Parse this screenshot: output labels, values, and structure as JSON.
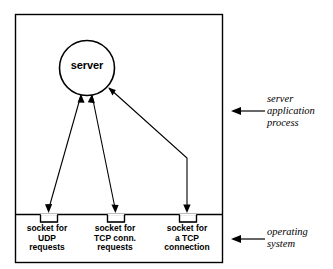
{
  "diagram": {
    "process_node": {
      "label": "server",
      "shape": "circle"
    },
    "sockets": [
      {
        "id": "udp-socket",
        "lines": [
          "socket for",
          "UDP",
          "requests"
        ]
      },
      {
        "id": "tcp-conn-socket",
        "lines": [
          "socket for",
          "TCP conn.",
          "requests"
        ]
      },
      {
        "id": "tcp-connection-socket",
        "lines": [
          "socket for",
          "a TCP",
          "connection"
        ]
      }
    ],
    "annotations": [
      {
        "id": "server-application-process",
        "lines": [
          "server",
          "application",
          "process"
        ]
      },
      {
        "id": "operating-system",
        "lines": [
          "operating",
          "system"
        ]
      }
    ],
    "colors": {
      "stroke": "#000000",
      "background": "#ffffff"
    }
  }
}
